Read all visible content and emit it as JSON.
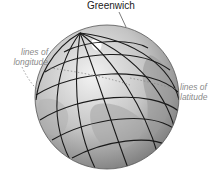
{
  "diagram": {
    "title_label": "Greenwich",
    "annotations": {
      "longitude": {
        "line1": "lines of",
        "line2": "longitude"
      },
      "latitude": {
        "line1": "lines of",
        "line2": "latitude"
      }
    },
    "globe": {
      "center": [
        107,
        97
      ],
      "radius": 72,
      "fill_light": "#e6e6e6",
      "fill_dark": "#8c8c8c",
      "grid_color": "#1a1a1a",
      "annotation_color": "#8a8a8a",
      "grid_labels": "small coordinate labels along grid lines (illegible at this resolution)"
    }
  }
}
